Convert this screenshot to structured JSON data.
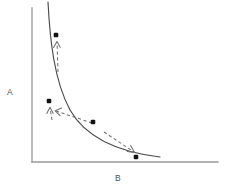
{
  "figure": {
    "title": "",
    "background_color": "#ffffff",
    "axis_color": "#9a9a9a",
    "curve_color": "#4a4a4a",
    "marker_color": "#121212",
    "arrow_color": "#6f6f6f"
  },
  "axes": {
    "y_axis": {
      "label": "A",
      "label_x": 10,
      "label_y": 93,
      "x": 32,
      "y_top": 8,
      "y_bottom": 162
    },
    "x_axis": {
      "label": "B",
      "label_x": 118,
      "label_y": 179,
      "y": 162,
      "x_left": 32,
      "x_right": 218
    }
  },
  "chart_data": {
    "type": "line",
    "title": "",
    "xlabel": "B",
    "ylabel": "A",
    "grid": false,
    "legend": null,
    "axis_ticks": {
      "x": [],
      "y": []
    },
    "series": [
      {
        "name": "tradeoff-curve",
        "style": "solid",
        "path": "M 48,2 C 50,40 54,80 70,110 C 86,138 118,152 160,157",
        "description": "Monotonically decreasing convex hyperbola-like frontier from upper-left to lower-right"
      }
    ],
    "points": [
      {
        "name": "point-1",
        "x": 56,
        "y": 35,
        "size": 4.6
      },
      {
        "name": "point-2",
        "x": 49,
        "y": 101,
        "size": 4.6
      },
      {
        "name": "point-3",
        "x": 93,
        "y": 122,
        "size": 4.6
      },
      {
        "name": "point-4",
        "x": 136,
        "y": 157,
        "size": 4.6
      }
    ],
    "annotations": [
      {
        "name": "arrow-1",
        "style": "dashed",
        "path": "M 58,72 L 57,42",
        "head": "M 53.6,47.5 L 57,41.4 L 60.2,47.2",
        "direction": "up",
        "from_point": "curve",
        "to_point": "point-1"
      },
      {
        "name": "arrow-2",
        "style": "dashed",
        "path": "M 52,120 L 50,108",
        "head": "M 46.8,113.4 L 50,107.2 L 53.2,113.2",
        "direction": "up",
        "from_point": "curve",
        "to_point": "point-2"
      },
      {
        "name": "arrow-3",
        "style": "dashed",
        "path": "M 92,123 L 56,111",
        "head": "M 61.6,108.0 L 55.2,110.8 L 60.0,115.6",
        "direction": "left",
        "from_point": "point-3",
        "to_point": "point-2"
      },
      {
        "name": "arrow-4",
        "style": "dashed",
        "path": "M 104,132 L 134,152",
        "head": "M 127.2,151.6 L 134.6,152.6 L 130.6,145.6",
        "direction": "down-right",
        "from_point": "curve",
        "to_point": "point-4"
      }
    ]
  }
}
